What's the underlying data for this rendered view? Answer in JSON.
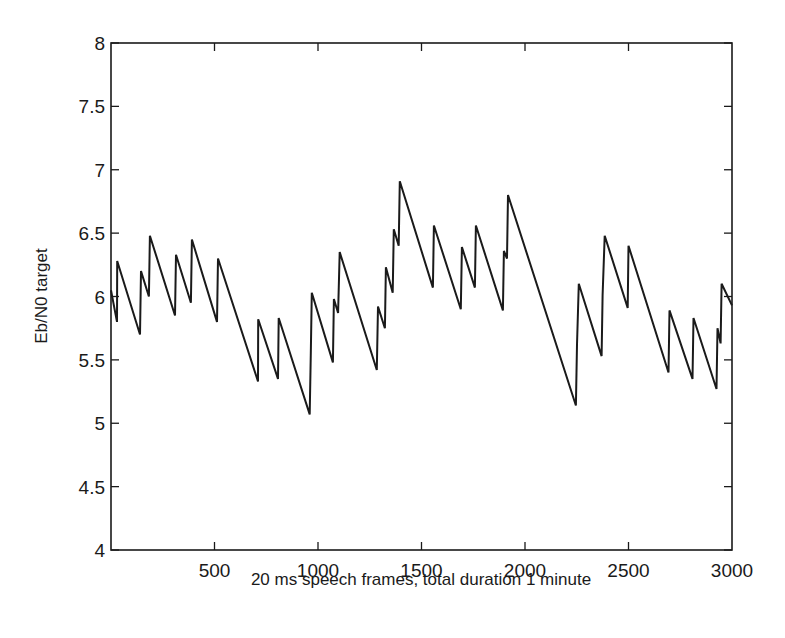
{
  "chart_data": {
    "type": "line",
    "title": "",
    "xlabel": "20 ms speech frames, total duration 1 minute",
    "ylabel": "Eb/N0 target",
    "xlim": [
      0,
      3000
    ],
    "ylim": [
      4,
      8
    ],
    "xticks": [
      500,
      1000,
      1500,
      2000,
      2500,
      3000
    ],
    "xtick_labels": [
      "500",
      "1000",
      "1500",
      "2000",
      "2500",
      "3000"
    ],
    "yticks": [
      4,
      4.5,
      5,
      5.5,
      6,
      6.5,
      7,
      7.5,
      8
    ],
    "ytick_labels": [
      "4",
      "4.5",
      "5",
      "5.5",
      "6",
      "6.5",
      "7",
      "7.5",
      "8"
    ],
    "grid": false,
    "legend": null,
    "line_color": "#1a1a1a",
    "series": [
      {
        "name": "Eb/N0 target",
        "x": [
          0,
          29,
          30,
          140,
          145,
          183,
          188,
          309,
          314,
          386,
          391,
          512,
          517,
          710,
          711,
          807,
          810,
          960,
          965,
          970,
          1072,
          1077,
          1097,
          1105,
          1284,
          1290,
          1323,
          1328,
          1361,
          1366,
          1390,
          1395,
          1555,
          1560,
          1690,
          1695,
          1758,
          1763,
          1893,
          1898,
          1913,
          1918,
          2246,
          2251,
          2260,
          2370,
          2375,
          2385,
          2496,
          2500,
          2693,
          2698,
          2809,
          2814,
          2925,
          2930,
          2945,
          2950,
          3000
        ],
        "y": [
          6.05,
          5.8,
          6.28,
          5.7,
          6.2,
          6.0,
          6.48,
          5.85,
          6.33,
          5.95,
          6.45,
          5.8,
          6.3,
          5.33,
          5.82,
          5.35,
          5.83,
          5.07,
          5.55,
          6.03,
          5.48,
          5.98,
          5.87,
          6.35,
          5.42,
          5.92,
          5.75,
          6.23,
          6.03,
          6.53,
          6.4,
          6.91,
          6.07,
          6.56,
          5.9,
          6.39,
          6.07,
          6.56,
          5.89,
          6.36,
          6.3,
          6.8,
          5.14,
          5.62,
          6.1,
          5.53,
          6.01,
          6.48,
          5.91,
          6.4,
          5.4,
          5.89,
          5.35,
          5.83,
          5.27,
          5.75,
          5.63,
          6.1,
          5.93
        ]
      }
    ]
  }
}
